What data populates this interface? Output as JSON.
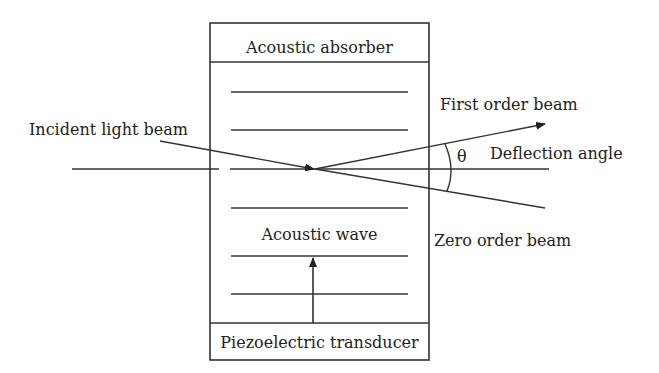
{
  "diagram": {
    "labels": {
      "absorber": "Acoustic absorber",
      "incident": "Incident light beam",
      "first_order": "First order beam",
      "deflection": "Deflection angle",
      "theta": "θ",
      "zero_order": "Zero order beam",
      "acoustic_wave": "Acoustic wave",
      "transducer": "Piezoelectric transducer"
    },
    "colors": {
      "stroke": "#333333",
      "text": "#222222",
      "background": "#ffffff"
    }
  }
}
